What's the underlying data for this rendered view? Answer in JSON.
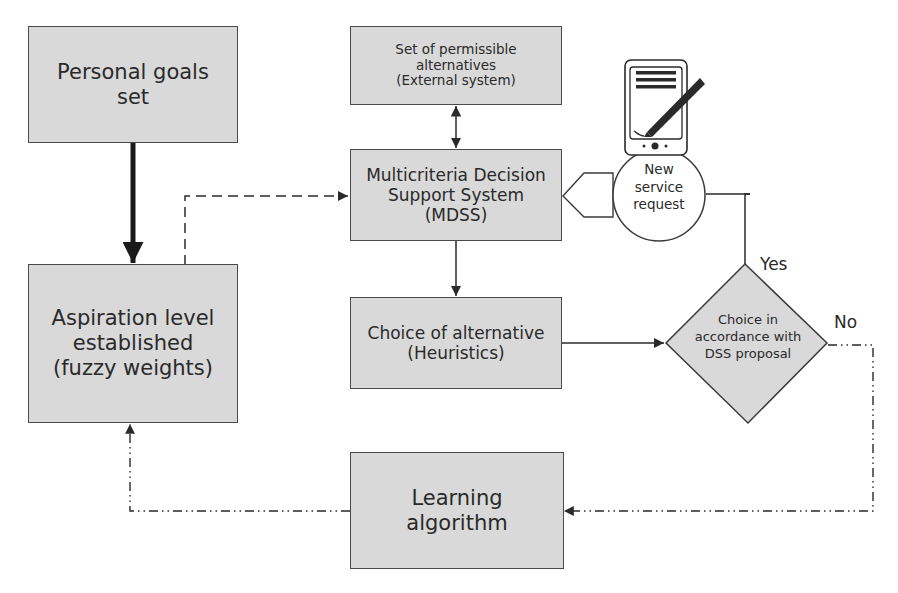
{
  "diagram": {
    "nodes": {
      "personal_goals": {
        "label": "Personal goals\nset"
      },
      "aspiration": {
        "label": "Aspiration level\nestablished\n(fuzzy weights)"
      },
      "permissible": {
        "label": "Set of permissible\nalternatives\n(External system)"
      },
      "mdss": {
        "label": "Multicriteria Decision\nSupport System\n(MDSS)"
      },
      "choice_alt": {
        "label": "Choice of alternative\n(Heuristics)"
      },
      "learning": {
        "label": "Learning\nalgorithm"
      },
      "service_request": {
        "label": "New\nservice\nrequest",
        "icon": "tablet-pen-icon"
      },
      "decision": {
        "label": "Choice in\naccordance with\nDSS proposal"
      }
    },
    "edge_labels": {
      "yes": "Yes",
      "no": "No"
    },
    "edges": [
      {
        "from": "personal_goals",
        "to": "aspiration",
        "style": "thick-solid"
      },
      {
        "from": "aspiration",
        "to": "mdss",
        "style": "dashed"
      },
      {
        "from": "permissible",
        "to": "mdss",
        "style": "solid-bidirectional"
      },
      {
        "from": "service_request",
        "to": "mdss",
        "style": "pentagon-pointer"
      },
      {
        "from": "mdss",
        "to": "choice_alt",
        "style": "solid"
      },
      {
        "from": "choice_alt",
        "to": "decision",
        "style": "solid"
      },
      {
        "from": "decision",
        "to": "service_request",
        "style": "solid",
        "label": "Yes"
      },
      {
        "from": "decision",
        "to": "learning",
        "style": "dash-dot-dot",
        "label": "No"
      },
      {
        "from": "learning",
        "to": "aspiration",
        "style": "dash-dot-dot"
      }
    ],
    "colors": {
      "box_fill": "#d9d9d9",
      "stroke": "#3a3a3a",
      "text": "#2a2a2a"
    }
  }
}
